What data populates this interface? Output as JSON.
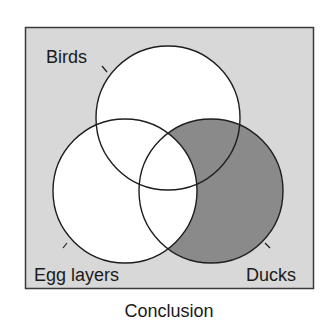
{
  "diagram": {
    "type": "venn",
    "caption": "Conclusion",
    "sets": [
      {
        "id": "birds",
        "label": "Birds",
        "cx": 168,
        "cy": 118,
        "r": 72
      },
      {
        "id": "egg_layers",
        "label": "Egg layers",
        "cx": 125,
        "cy": 191,
        "r": 72
      },
      {
        "id": "ducks",
        "label": "Ducks",
        "cx": 211,
        "cy": 191,
        "r": 72
      }
    ],
    "shaded_region": "Ducks outside Egg layers",
    "colors": {
      "page_background": "#ffffff",
      "frame_background": "#d8d8d8",
      "frame_border": "#3a3a3a",
      "circle_fill": "#ffffff",
      "circle_stroke": "#1e1e1e",
      "shaded_fill": "#8a8a8a",
      "text": "#1a1a1a"
    }
  }
}
